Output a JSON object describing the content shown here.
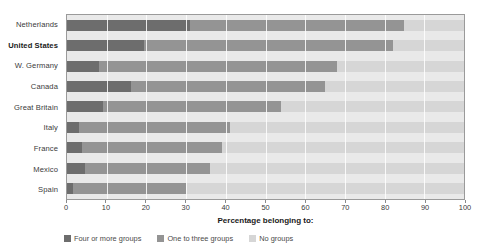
{
  "chart_data": {
    "type": "bar",
    "subtype": "stacked-horizontal-bar",
    "title": "",
    "xlabel": "Percentage belonging to:",
    "ylabel": "",
    "xlim": [
      0,
      100
    ],
    "ticks": [
      0,
      10,
      20,
      30,
      40,
      50,
      60,
      70,
      80,
      90,
      100
    ],
    "grid": true,
    "legend_position": "bottom-left",
    "categories": [
      "Netherlands",
      "United States",
      "W. Germany",
      "Canada",
      "Great Britain",
      "Italy",
      "France",
      "Mexico",
      "Spain"
    ],
    "emphasized_category": "United States",
    "series": [
      {
        "name": "Four or more groups",
        "color": "#6d6d6d",
        "values": [
          31,
          19.5,
          8,
          16,
          9,
          3,
          3.8,
          4.5,
          1.5
        ]
      },
      {
        "name": "One to three groups",
        "color": "#949494",
        "values": [
          54,
          62.5,
          60,
          49,
          45,
          38,
          35.2,
          31.5,
          28.5
        ]
      },
      {
        "name": "No groups",
        "color": "#d6d6d6",
        "values": [
          15,
          18,
          32,
          35,
          46,
          59,
          61,
          64,
          70
        ]
      }
    ],
    "cumulative_endpoints": [
      {
        "category": "Netherlands",
        "dark_end": 31,
        "mid_end": 85
      },
      {
        "category": "United States",
        "dark_end": 19.5,
        "mid_end": 82
      },
      {
        "category": "W. Germany",
        "dark_end": 8,
        "mid_end": 68
      },
      {
        "category": "Canada",
        "dark_end": 16,
        "mid_end": 65
      },
      {
        "category": "Great Britain",
        "dark_end": 9,
        "mid_end": 54
      },
      {
        "category": "Italy",
        "dark_end": 3,
        "mid_end": 41
      },
      {
        "category": "France",
        "dark_end": 3.8,
        "mid_end": 39
      },
      {
        "category": "Mexico",
        "dark_end": 4.5,
        "mid_end": 36
      },
      {
        "category": "Spain",
        "dark_end": 1.5,
        "mid_end": 30
      }
    ]
  },
  "legend": {
    "items": [
      {
        "label": "Four or more groups",
        "color": "#6d6d6d"
      },
      {
        "label": "One to three groups",
        "color": "#949494"
      },
      {
        "label": "No groups",
        "color": "#d6d6d6"
      }
    ]
  }
}
